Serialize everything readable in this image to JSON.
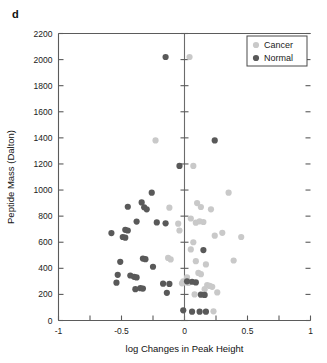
{
  "panel": {
    "label": "d"
  },
  "legend": {
    "position": "top-right",
    "entries": [
      {
        "label": "Cancer",
        "color": "#c9c9c9",
        "marker": "legend-dot-cancer"
      },
      {
        "label": "Normal",
        "color": "#595959",
        "marker": "legend-dot-normal"
      }
    ]
  },
  "colors": {
    "cancer": "#c9c9c9",
    "normal": "#595959",
    "axis": "#5b5b5b",
    "reference_line": "#6b6b6b",
    "text": "#1a1a1a"
  },
  "chart_data": {
    "type": "scatter",
    "title": "",
    "xlabel": "log Changes in Peak Height",
    "ylabel": "Peptide Mass (Dalton)",
    "xlim": [
      -1,
      1
    ],
    "ylim": [
      0,
      2200
    ],
    "xticks": [
      -1,
      -0.75,
      -0.5,
      -0.25,
      0,
      0.25,
      0.5,
      0.75,
      1
    ],
    "xtick_labels": [
      "-1",
      "",
      "-0.5",
      "",
      "0",
      "",
      "0.5",
      "",
      "1"
    ],
    "yticks": [
      0,
      200,
      400,
      600,
      800,
      1000,
      1200,
      1400,
      1600,
      1800,
      2000,
      2200
    ],
    "ytick_labels": [
      "0",
      "200",
      "400",
      "600",
      "800",
      "1000",
      "1200",
      "1400",
      "1600",
      "1800",
      "2000",
      "2200"
    ],
    "grid": false,
    "reference_lines": [
      {
        "axis": "x",
        "value": 0
      }
    ],
    "legend_position": "upper right",
    "series": [
      {
        "name": "Normal",
        "color": "#595959",
        "points": [
          [
            -0.15,
            2020
          ],
          [
            -0.04,
            1185
          ],
          [
            0.24,
            1380
          ],
          [
            -0.26,
            980
          ],
          [
            -0.34,
            905
          ],
          [
            -0.45,
            872
          ],
          [
            -0.32,
            868
          ],
          [
            -0.3,
            852
          ],
          [
            -0.38,
            758
          ],
          [
            -0.22,
            752
          ],
          [
            -0.15,
            745
          ],
          [
            -0.58,
            670
          ],
          [
            -0.47,
            695
          ],
          [
            -0.45,
            690
          ],
          [
            -0.49,
            640
          ],
          [
            -0.47,
            635
          ],
          [
            0.15,
            540
          ],
          [
            -0.33,
            475
          ],
          [
            -0.31,
            470
          ],
          [
            -0.51,
            450
          ],
          [
            -0.25,
            412
          ],
          [
            -0.53,
            350
          ],
          [
            -0.43,
            345
          ],
          [
            -0.4,
            335
          ],
          [
            -0.38,
            330
          ],
          [
            -0.54,
            290
          ],
          [
            -0.17,
            282
          ],
          [
            -0.12,
            280
          ],
          [
            0.02,
            300
          ],
          [
            0.06,
            297
          ],
          [
            0.09,
            292
          ],
          [
            -0.39,
            240
          ],
          [
            -0.35,
            248
          ],
          [
            -0.33,
            245
          ],
          [
            -0.14,
            212
          ],
          [
            0.13,
            198
          ],
          [
            0.16,
            196
          ],
          [
            -0.01,
            78
          ],
          [
            0.06,
            68
          ],
          [
            0.12,
            68
          ],
          [
            0.17,
            68
          ]
        ]
      },
      {
        "name": "Cancer",
        "color": "#c9c9c9",
        "points": [
          [
            0.04,
            2020
          ],
          [
            -0.23,
            1380
          ],
          [
            0.07,
            1185
          ],
          [
            0.35,
            980
          ],
          [
            0.1,
            900
          ],
          [
            0.13,
            870
          ],
          [
            -0.12,
            865
          ],
          [
            0.21,
            852
          ],
          [
            0.05,
            782
          ],
          [
            0.12,
            760
          ],
          [
            0.15,
            755
          ],
          [
            0.09,
            750
          ],
          [
            -0.05,
            742
          ],
          [
            0.3,
            672
          ],
          [
            0.45,
            640
          ],
          [
            -0.04,
            690
          ],
          [
            0.24,
            650
          ],
          [
            0.07,
            600
          ],
          [
            0.05,
            545
          ],
          [
            0.39,
            460
          ],
          [
            -0.13,
            480
          ],
          [
            -0.11,
            468
          ],
          [
            0.09,
            455
          ],
          [
            0.17,
            430
          ],
          [
            0.11,
            365
          ],
          [
            0.13,
            355
          ],
          [
            0.02,
            330
          ],
          [
            -0.01,
            300
          ],
          [
            0.0,
            292
          ],
          [
            0.03,
            288
          ],
          [
            -0.02,
            285
          ],
          [
            0.18,
            272
          ],
          [
            0.2,
            265
          ],
          [
            0.22,
            258
          ],
          [
            0.16,
            240
          ],
          [
            0.26,
            215
          ],
          [
            0.08,
            200
          ],
          [
            0.23,
            70
          ]
        ]
      }
    ]
  }
}
